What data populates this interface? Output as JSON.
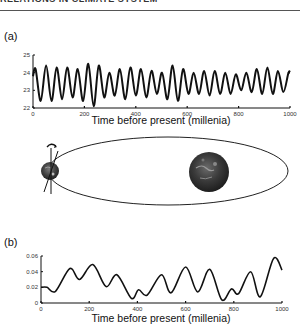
{
  "header": {
    "text": "RELATIONS IN CLIMATE SYSTEM"
  },
  "panels": {
    "a": {
      "label": "(a)"
    },
    "b": {
      "label": "(b)"
    }
  },
  "diagram": {
    "elements": [
      "orbit-ellipse",
      "earth-globe",
      "sun-globe",
      "spin-axis",
      "precession-arrow"
    ]
  },
  "chart_data": [
    {
      "type": "line",
      "panel": "(a)",
      "title": "",
      "xlabel": "Time before present (millenia)",
      "ylabel": "",
      "xlim": [
        0,
        1000
      ],
      "ylim": [
        22,
        25
      ],
      "xticks": [
        0,
        200,
        400,
        600,
        800,
        1000
      ],
      "yticks": [
        22,
        23,
        24,
        25
      ],
      "xtick_labels": [
        "0",
        "200",
        "400",
        "600",
        "800",
        "1000"
      ],
      "ytick_labels": [
        "22",
        "23",
        "24",
        "25"
      ],
      "grid": false,
      "legend": null,
      "series": [
        {
          "name": "obliquity",
          "period": 41,
          "x": [
            0,
            10,
            30,
            51,
            72,
            92,
            113,
            133,
            154,
            174,
            195,
            215,
            236,
            256,
            277,
            297,
            318,
            338,
            359,
            379,
            400,
            420,
            441,
            461,
            482,
            502,
            523,
            543,
            564,
            584,
            605,
            625,
            646,
            666,
            687,
            707,
            728,
            748,
            769,
            789,
            810,
            830,
            851,
            871,
            892,
            912,
            933,
            953,
            974,
            994,
            1000
          ],
          "values": [
            23.8,
            24.2,
            22.4,
            24.4,
            22.4,
            24.3,
            22.5,
            24.3,
            22.6,
            24.2,
            22.4,
            24.5,
            22.1,
            24.4,
            22.6,
            24.0,
            22.7,
            24.2,
            22.5,
            24.3,
            22.7,
            24.2,
            22.6,
            24.1,
            22.8,
            24.0,
            22.5,
            24.4,
            22.4,
            24.2,
            22.8,
            24.0,
            22.8,
            24.1,
            22.7,
            24.1,
            22.8,
            24.0,
            22.8,
            23.9,
            23.0,
            24.0,
            22.9,
            24.2,
            22.8,
            24.3,
            22.8,
            24.1,
            22.9,
            24.0,
            24.0
          ]
        }
      ]
    },
    {
      "type": "line",
      "panel": "(b)",
      "title": "",
      "xlabel": "Time before present (millenia)",
      "ylabel": "",
      "xlim": [
        0,
        1000
      ],
      "ylim": [
        0,
        0.06
      ],
      "xticks": [
        0,
        200,
        400,
        600,
        800,
        1000
      ],
      "yticks": [
        0,
        0.02,
        0.04,
        0.06
      ],
      "xtick_labels": [
        "0",
        "200",
        "400",
        "600",
        "800",
        "1000"
      ],
      "ytick_labels": [
        "0",
        "0.02",
        "0.04",
        "0.06"
      ],
      "grid": false,
      "legend": null,
      "series": [
        {
          "name": "eccentricity",
          "x": [
            0,
            25,
            60,
            120,
            160,
            215,
            270,
            315,
            375,
            405,
            440,
            500,
            540,
            600,
            650,
            700,
            750,
            790,
            820,
            870,
            910,
            965,
            1000
          ],
          "values": [
            0.02,
            0.02,
            0.015,
            0.044,
            0.03,
            0.049,
            0.021,
            0.036,
            0.006,
            0.017,
            0.01,
            0.036,
            0.013,
            0.046,
            0.014,
            0.043,
            0.004,
            0.018,
            0.012,
            0.04,
            0.008,
            0.057,
            0.042
          ]
        }
      ]
    }
  ]
}
